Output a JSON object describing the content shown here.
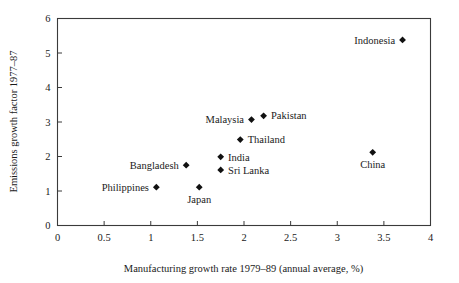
{
  "chart_data": {
    "type": "scatter",
    "title": "",
    "xlabel": "Manufacturing growth rate 1979–89 (annual average, %)",
    "ylabel": "Emissions growth factor 1977–87",
    "xlim": [
      0,
      4
    ],
    "ylim": [
      0,
      6
    ],
    "xticks": [
      "0",
      "0.5",
      "1",
      "1.5",
      "2",
      "2.5",
      "3",
      "3.5",
      "4"
    ],
    "xtick_values": [
      0,
      0.5,
      1,
      1.5,
      2,
      2.5,
      3,
      3.5,
      4
    ],
    "yticks": [
      "0",
      "1",
      "2",
      "3",
      "4",
      "5",
      "6"
    ],
    "ytick_values": [
      0,
      1,
      2,
      3,
      4,
      5,
      6
    ],
    "grid": false,
    "legend": "none",
    "marker_style": "filled-diamond",
    "marker_color": "#111111",
    "axis_color": "#3a3a3a",
    "background": "#ffffff",
    "points": [
      {
        "label": "Indonesia",
        "x": 3.7,
        "y": 5.38,
        "label_pos": "left"
      },
      {
        "label": "Pakistan",
        "x": 2.21,
        "y": 3.18,
        "label_pos": "right"
      },
      {
        "label": "Malaysia",
        "x": 2.08,
        "y": 3.07,
        "label_pos": "left"
      },
      {
        "label": "Thailand",
        "x": 1.96,
        "y": 2.49,
        "label_pos": "right"
      },
      {
        "label": "China",
        "x": 3.38,
        "y": 2.12,
        "label_pos": "below"
      },
      {
        "label": "India",
        "x": 1.75,
        "y": 1.99,
        "label_pos": "right"
      },
      {
        "label": "Bangladesh",
        "x": 1.38,
        "y": 1.75,
        "label_pos": "left"
      },
      {
        "label": "Sri Lanka",
        "x": 1.75,
        "y": 1.61,
        "label_pos": "right"
      },
      {
        "label": "Philippines",
        "x": 1.06,
        "y": 1.11,
        "label_pos": "left"
      },
      {
        "label": "Japan",
        "x": 1.52,
        "y": 1.11,
        "label_pos": "below"
      }
    ]
  }
}
